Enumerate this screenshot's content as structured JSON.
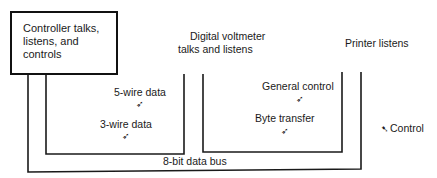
{
  "devices": {
    "controller": {
      "label": "Controller talks,\nlistens, and\ncontrols"
    },
    "voltmeter": {
      "label_line1": "Digital voltmeter",
      "label_line2": "talks and listens"
    },
    "printer": {
      "label": "Printer listens"
    }
  },
  "buses": {
    "five_wire": "5-wire data",
    "three_wire": "3-wire data",
    "general_control": "General control",
    "byte_transfer": "Byte transfer",
    "control": "Control",
    "data_bus": "8-bit data bus"
  },
  "icons": {
    "pointer_arrow": "➶",
    "control_arrow": "➷"
  }
}
